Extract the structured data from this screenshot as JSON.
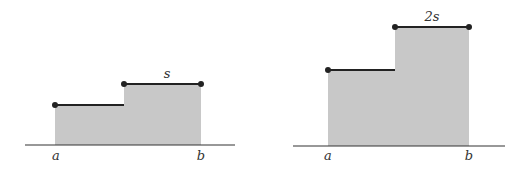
{
  "colors": {
    "background": "#ffffff",
    "fill": "#c8c8c8",
    "line": "#222222",
    "baseline": "#333333",
    "dot": "#222222",
    "label": "#333333"
  },
  "panels": [
    {
      "id": "left",
      "baseline": {
        "x1": 25,
        "x2": 235,
        "y": 145
      },
      "region": {
        "x_start": 55,
        "x_step": 124,
        "x_end": 201,
        "y_low": 105,
        "y_high": 84
      },
      "labels": {
        "a": {
          "text": "a",
          "x": 56,
          "y": 160
        },
        "b": {
          "text": "b",
          "x": 201,
          "y": 160
        },
        "top": {
          "text": "s",
          "x": 167,
          "y": 78
        }
      }
    },
    {
      "id": "right",
      "baseline": {
        "x1": 293,
        "x2": 505,
        "y": 146
      },
      "region": {
        "x_start": 328,
        "x_step": 395,
        "x_end": 469,
        "y_low": 70,
        "y_high": 27
      },
      "labels": {
        "a": {
          "text": "a",
          "x": 328,
          "y": 160
        },
        "b": {
          "text": "b",
          "x": 469,
          "y": 160
        },
        "top": {
          "text": "2s",
          "x": 432,
          "y": 21
        }
      }
    }
  ]
}
